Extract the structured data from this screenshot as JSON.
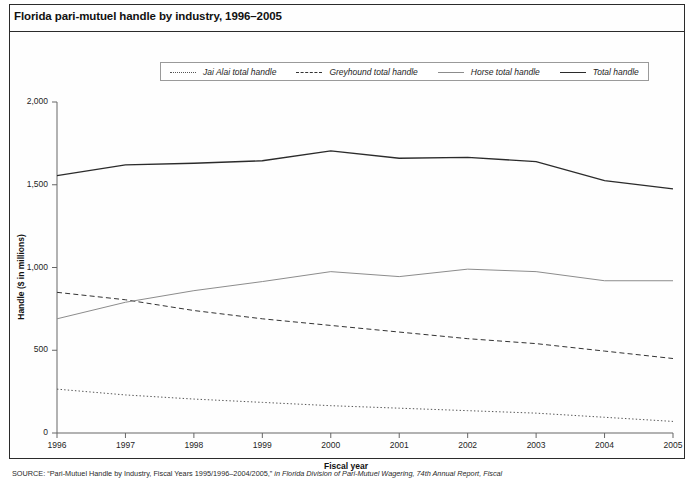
{
  "figure": {
    "title": "Florida pari-mutuel handle by industry, 1996–2005",
    "source_lead": "SOURCE:",
    "source_quoted": "“Pari-Mutuel Handle by Industry, Fiscal Years 1995/1996–2004/2005,”",
    "source_rest": "in Florida Division of Pari-Mutuel Wagering, 74th Annual Report, Fiscal"
  },
  "legend": {
    "position": "top-center",
    "items": [
      {
        "label": "Jai Alai total handle",
        "key": "dotted-line-key"
      },
      {
        "label": "Greyhound total handle",
        "key": "dashed-line-key"
      },
      {
        "label": "Horse total handle",
        "key": "thin-solid-line-key"
      },
      {
        "label": "Total handle",
        "key": "thick-solid-line-key"
      }
    ]
  },
  "chart_data": {
    "type": "line",
    "title": "Florida pari-mutuel handle by industry, 1996–2005",
    "xlabel": "Fiscal year",
    "ylabel": "Handle ($ in millions)",
    "x": [
      1996,
      1997,
      1998,
      1999,
      2000,
      2001,
      2002,
      2003,
      2004,
      2005
    ],
    "xtick_labels": [
      "1996",
      "1997",
      "1998",
      "1999",
      "2000",
      "2001",
      "2002",
      "2003",
      "2004",
      "2005"
    ],
    "ytick_labels": [
      "0",
      "500",
      "1,000",
      "1,500",
      "2,000"
    ],
    "yticks": [
      0,
      500,
      1000,
      1500,
      2000
    ],
    "ylim": [
      0,
      2000
    ],
    "xlim": [
      1996,
      2005
    ],
    "grid": false,
    "series": [
      {
        "name": "Jai Alai total handle",
        "style": "dotted",
        "color": "#555555",
        "values": [
          265,
          230,
          205,
          185,
          165,
          150,
          135,
          120,
          95,
          70
        ]
      },
      {
        "name": "Greyhound total handle",
        "style": "dashed",
        "color": "#333333",
        "values": [
          850,
          805,
          740,
          690,
          650,
          610,
          570,
          540,
          495,
          450
        ]
      },
      {
        "name": "Horse total handle",
        "style": "solid-thin",
        "color": "#8c8c8c",
        "values": [
          690,
          790,
          860,
          915,
          975,
          945,
          990,
          975,
          920,
          920
        ]
      },
      {
        "name": "Total handle",
        "style": "solid-thick",
        "color": "#2b2b2b",
        "values": [
          1555,
          1620,
          1630,
          1645,
          1705,
          1660,
          1665,
          1640,
          1525,
          1475
        ]
      }
    ]
  },
  "axes": {
    "geometry": {
      "left": 57,
      "right": 673,
      "top": 102,
      "bottom": 433
    }
  }
}
